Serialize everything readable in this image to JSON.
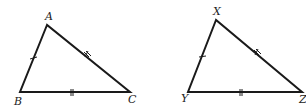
{
  "diagram": {
    "type": "congruent-triangles",
    "colors": {
      "stroke": "#1a1a1a",
      "label": "#222222",
      "background": "#ffffff"
    },
    "triangles": [
      {
        "name": "ABC",
        "vertices": [
          {
            "label": "A",
            "x": 47,
            "y": 25,
            "lx": 45,
            "ly": 20
          },
          {
            "label": "B",
            "x": 20,
            "y": 92,
            "lx": 14,
            "ly": 105
          },
          {
            "label": "C",
            "x": 130,
            "y": 92,
            "lx": 128,
            "ly": 103
          }
        ],
        "sides": [
          {
            "name": "AB",
            "ticks": 1
          },
          {
            "name": "AC",
            "ticks": 2
          },
          {
            "name": "BC",
            "ticks": 2
          }
        ]
      },
      {
        "name": "XYZ",
        "vertices": [
          {
            "label": "X",
            "x": 216,
            "y": 20,
            "lx": 213,
            "ly": 15
          },
          {
            "label": "Y",
            "x": 188,
            "y": 92,
            "lx": 181,
            "ly": 102
          },
          {
            "label": "Z",
            "x": 302,
            "y": 92,
            "lx": 299,
            "ly": 103
          }
        ],
        "sides": [
          {
            "name": "XY",
            "ticks": 1
          },
          {
            "name": "XZ",
            "ticks": 2
          },
          {
            "name": "YZ",
            "ticks": 2
          }
        ]
      }
    ]
  }
}
